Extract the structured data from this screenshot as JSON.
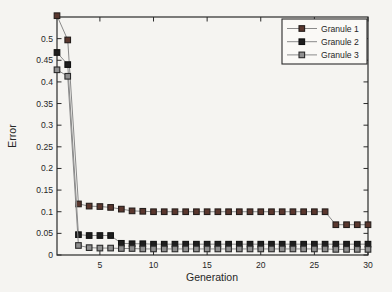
{
  "figure": {
    "background": "#f5f4f1",
    "axis_color": "#2a2a2a",
    "text_color": "#262626"
  },
  "chart_data": {
    "type": "line",
    "title": "",
    "xlabel": "Generation",
    "ylabel": "Error",
    "xlim": [
      1,
      30
    ],
    "ylim": [
      0,
      0.55
    ],
    "xticks": [
      5,
      10,
      15,
      20,
      25,
      30
    ],
    "yticks": [
      0,
      0.05,
      0.1,
      0.15,
      0.2,
      0.25,
      0.3,
      0.35,
      0.4,
      0.45,
      0.5
    ],
    "ytick_labels": [
      "0",
      "0.05",
      "0.1",
      "0.15",
      "0.2",
      "0.25",
      "0.3",
      "0.35",
      "0.4",
      "0.45",
      "0.5"
    ],
    "grid": false,
    "legend": {
      "position": "top-right",
      "border": true,
      "background": "#faf9f6"
    },
    "x": [
      1,
      2,
      3,
      4,
      5,
      6,
      7,
      8,
      9,
      10,
      11,
      12,
      13,
      14,
      15,
      16,
      17,
      18,
      19,
      20,
      21,
      22,
      23,
      24,
      25,
      26,
      27,
      28,
      29,
      30
    ],
    "series": [
      {
        "name": "Granule 1",
        "marker": "square",
        "line_color": "#8a8a8a",
        "marker_fill": "#5a372e",
        "marker_edge": "#241d1b",
        "values": [
          0.553,
          0.497,
          0.118,
          0.113,
          0.112,
          0.11,
          0.106,
          0.102,
          0.101,
          0.1,
          0.1,
          0.1,
          0.1,
          0.1,
          0.1,
          0.1,
          0.1,
          0.1,
          0.1,
          0.1,
          0.1,
          0.1,
          0.1,
          0.1,
          0.1,
          0.1,
          0.07,
          0.07,
          0.07,
          0.07
        ]
      },
      {
        "name": "Granule 2",
        "marker": "square",
        "line_color": "#8a8a8a",
        "marker_fill": "#1e1e1e",
        "marker_edge": "#111111",
        "values": [
          0.468,
          0.44,
          0.047,
          0.045,
          0.045,
          0.045,
          0.027,
          0.026,
          0.026,
          0.025,
          0.025,
          0.025,
          0.025,
          0.025,
          0.025,
          0.025,
          0.025,
          0.025,
          0.025,
          0.025,
          0.025,
          0.025,
          0.025,
          0.025,
          0.025,
          0.025,
          0.025,
          0.025,
          0.025,
          0.025
        ]
      },
      {
        "name": "Granule 3",
        "marker": "square",
        "line_color": "#8a8a8a",
        "marker_fill": "#8f8f8f",
        "marker_edge": "#2a2a2a",
        "values": [
          0.428,
          0.413,
          0.022,
          0.017,
          0.016,
          0.016,
          0.015,
          0.015,
          0.014,
          0.014,
          0.014,
          0.014,
          0.014,
          0.014,
          0.014,
          0.014,
          0.014,
          0.014,
          0.014,
          0.014,
          0.014,
          0.014,
          0.014,
          0.014,
          0.014,
          0.014,
          0.013,
          0.013,
          0.013,
          0.013
        ]
      }
    ]
  }
}
